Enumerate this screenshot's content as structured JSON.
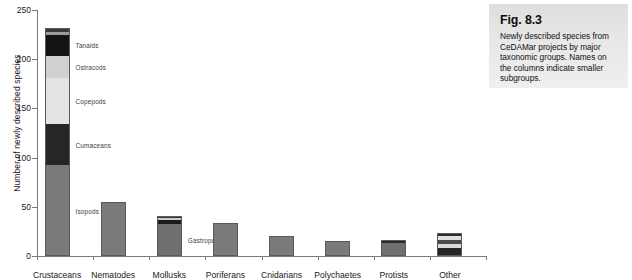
{
  "figure": {
    "label": "Fig. 8.3",
    "caption": "Newly described species from CeDAMar projects by major taxonomic groups. Names on the columns indicate smaller subgroups."
  },
  "chart_data": {
    "type": "bar",
    "stacked": true,
    "title": "",
    "xlabel": "",
    "ylabel": "Number of newly described species",
    "ylim": [
      0,
      250
    ],
    "yticks": [
      0,
      50,
      100,
      150,
      200,
      250
    ],
    "ytick_labels": [
      "0",
      "50",
      "100",
      "150",
      "200",
      "250"
    ],
    "grid": false,
    "legend": "none",
    "categories": [
      "Crustaceans",
      "Nematodes",
      "Mollusks",
      "Poriferans",
      "Cnidarians",
      "Polychaetes",
      "Protists",
      "Other"
    ],
    "totals": [
      232,
      55,
      41,
      34,
      20,
      15,
      16,
      23
    ],
    "bars": [
      {
        "category": "Crustaceans",
        "total": 232,
        "segments": [
          {
            "name": "Isopods",
            "value": 92,
            "color": "#7a7a7a",
            "annotated": true
          },
          {
            "name": "Cumaceans",
            "value": 42,
            "color": "#262626",
            "annotated": true
          },
          {
            "name": "Copepods",
            "value": 47,
            "color": "#e3e3e3",
            "annotated": true
          },
          {
            "name": "Ostracods",
            "value": 22,
            "color": "#d0d0d0",
            "annotated": true
          },
          {
            "name": "Tanaids",
            "value": 22,
            "color": "#131313",
            "annotated": true
          },
          {
            "name": "sub-a",
            "value": 3,
            "color": "#9a9a9a",
            "annotated": false
          },
          {
            "name": "sub-b",
            "value": 4,
            "color": "#3a3a3a",
            "annotated": false
          }
        ]
      },
      {
        "category": "Nematodes",
        "total": 55,
        "segments": [
          {
            "name": "Nematodes",
            "value": 55,
            "color": "#7a7a7a",
            "annotated": false
          }
        ]
      },
      {
        "category": "Mollusks",
        "total": 41,
        "segments": [
          {
            "name": "Gastropods",
            "value": 33,
            "color": "#6f6f6f",
            "annotated": true
          },
          {
            "name": "sub-c",
            "value": 4,
            "color": "#1b1b1b",
            "annotated": false
          },
          {
            "name": "sub-d",
            "value": 2,
            "color": "#cccccc",
            "annotated": false
          },
          {
            "name": "sub-e",
            "value": 2,
            "color": "#3a3a3a",
            "annotated": false
          }
        ]
      },
      {
        "category": "Poriferans",
        "total": 34,
        "segments": [
          {
            "name": "Poriferans",
            "value": 34,
            "color": "#7a7a7a",
            "annotated": false
          }
        ]
      },
      {
        "category": "Cnidarians",
        "total": 20,
        "segments": [
          {
            "name": "Cnidarians",
            "value": 20,
            "color": "#7a7a7a",
            "annotated": false
          }
        ]
      },
      {
        "category": "Polychaetes",
        "total": 15,
        "segments": [
          {
            "name": "Polychaetes",
            "value": 15,
            "color": "#7a7a7a",
            "annotated": false
          }
        ]
      },
      {
        "category": "Protists",
        "total": 16,
        "segments": [
          {
            "name": "Protists",
            "value": 13,
            "color": "#6f6f6f",
            "annotated": false
          },
          {
            "name": "sub-f",
            "value": 3,
            "color": "#2a2a2a",
            "annotated": false
          }
        ]
      },
      {
        "category": "Other",
        "total": 23,
        "segments": [
          {
            "name": "other-1",
            "value": 8,
            "color": "#242424",
            "annotated": false
          },
          {
            "name": "other-2",
            "value": 4,
            "color": "#d8d8d8",
            "annotated": false
          },
          {
            "name": "other-3",
            "value": 4,
            "color": "#4a4a4a",
            "annotated": false
          },
          {
            "name": "other-4",
            "value": 4,
            "color": "#e0e0e0",
            "annotated": false
          },
          {
            "name": "other-5",
            "value": 3,
            "color": "#2e2e2e",
            "annotated": false
          }
        ]
      }
    ]
  }
}
